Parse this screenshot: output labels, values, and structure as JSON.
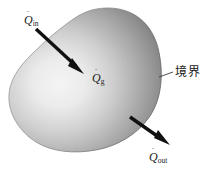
{
  "diagram": {
    "background_color": "#ffffff",
    "body": {
      "name": "control-volume-blob",
      "fill_light": "#f2f2f2",
      "fill_mid": "#b4b4b4",
      "fill_dark": "#6b6b6b",
      "edge_color": "#5e5e5e"
    },
    "labels": {
      "q_in": {
        "symbol": "Q",
        "dot": "˙",
        "subscript": "in"
      },
      "q_gen": {
        "symbol": "Q",
        "dot": "˙",
        "subscript": "g"
      },
      "q_out": {
        "symbol": "Q",
        "dot": "˙",
        "subscript": "out"
      },
      "boundary": "境界"
    },
    "arrows": {
      "in": {
        "name": "heat-in-arrow",
        "color": "#111111",
        "direction": "down-right"
      },
      "out": {
        "name": "heat-out-arrow",
        "color": "#111111",
        "direction": "down-right"
      }
    },
    "leader_line": {
      "name": "boundary-leader-line",
      "color": "#3a3a3a"
    }
  }
}
